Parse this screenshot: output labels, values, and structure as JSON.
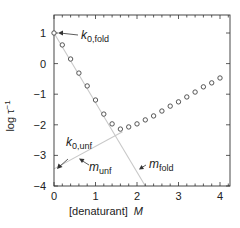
{
  "chart_data": {
    "type": "scatter",
    "title": "",
    "xlabel": "[denaturant]",
    "xlabel_unit": "M",
    "ylabel": "log τ",
    "ylabel_sup": "−1",
    "xlim": [
      0,
      4.2
    ],
    "ylim": [
      -4,
      1.2
    ],
    "xticks": [
      0,
      1,
      2,
      3,
      4
    ],
    "xtick_labels": [
      "0",
      "1",
      "2",
      "3",
      "4"
    ],
    "yticks": [
      1,
      0,
      -1,
      -2,
      -3,
      -4
    ],
    "ytick_labels": [
      "1",
      "0",
      "−1",
      "−2",
      "−3",
      "−4"
    ],
    "grid": false,
    "legend": null,
    "series": [
      {
        "name": "observed relaxation rate",
        "marker": "open-circle",
        "x": [
          0.0,
          0.2,
          0.4,
          0.6,
          0.8,
          1.0,
          1.2,
          1.4,
          1.6,
          1.8,
          2.0,
          2.2,
          2.4,
          2.6,
          2.8,
          3.0,
          3.2,
          3.4,
          3.6,
          3.8,
          4.0
        ],
        "y": [
          1.0,
          0.61,
          0.15,
          -0.31,
          -0.73,
          -1.19,
          -1.65,
          -1.97,
          -2.14,
          -2.07,
          -1.97,
          -1.84,
          -1.71,
          -1.55,
          -1.39,
          -1.25,
          -1.09,
          -0.93,
          -0.76,
          -0.63,
          -0.47
        ]
      }
    ],
    "lines": [
      {
        "name": "folding limb extrapolation",
        "x": [
          0,
          2.2
        ],
        "y": [
          1.0,
          -4.0
        ],
        "color": "#c8c8c8"
      },
      {
        "name": "unfolding limb extrapolation",
        "x": [
          0,
          1.65
        ],
        "y": [
          -3.44,
          -2.23
        ],
        "color": "#c8c8c8"
      }
    ],
    "annotations": [
      {
        "text": "k",
        "sub": "0,fold",
        "points_to": [
          0,
          1.0
        ]
      },
      {
        "text": "k",
        "sub": "0,unf",
        "points_to": [
          0,
          -3.44
        ]
      },
      {
        "text": "m",
        "sub": "unf",
        "points_to": "unfolding line slope"
      },
      {
        "text": "m",
        "sub": "fold",
        "points_to": "folding line slope"
      }
    ]
  },
  "labels": {
    "ylabel_main": "log τ",
    "ylabel_sup": "−1",
    "xlabel_main": "[denaturant]",
    "xlabel_unit": "M",
    "k0fold_main": "k",
    "k0fold_sub": "0,fold",
    "k0unf_main": "k",
    "k0unf_sub": "0,unf",
    "munf_main": "m",
    "munf_sub": "unf",
    "mfold_main": "m",
    "mfold_sub": "fold"
  },
  "colors": {
    "axis": "#333333",
    "marker": "#444444",
    "fit_line": "#c8c8c8",
    "text": "#222222"
  }
}
